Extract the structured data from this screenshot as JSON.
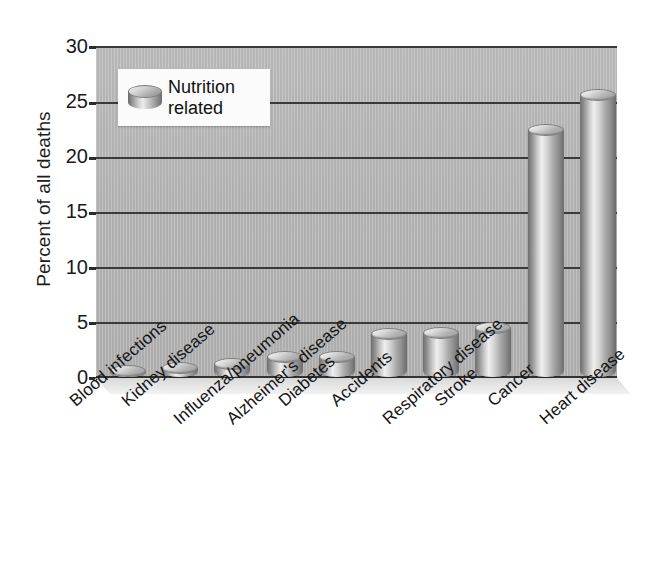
{
  "chart_data": {
    "type": "bar",
    "title": "",
    "xlabel": "",
    "ylabel": "Percent of all deaths",
    "ylim": [
      0,
      30
    ],
    "yticks": [
      0,
      5,
      10,
      15,
      20,
      25,
      30
    ],
    "ytick_labels": [
      "0",
      "5",
      "10",
      "15",
      "20",
      "25",
      "30"
    ],
    "grid": true,
    "legend_position": "upper-left",
    "categories": [
      "Blood infections",
      "Kidney disease",
      "Influenza/pneumonia",
      "Alzheimer's disease",
      "Diabetes",
      "Accidents",
      "Respiratory disease",
      "Stroke",
      "Cancer",
      "Heart disease"
    ],
    "series": [
      {
        "name": "Nutrition related",
        "values": [
          1.1,
          1.4,
          1.7,
          2.4,
          2.4,
          4.4,
          4.5,
          5.0,
          22.9,
          26.1
        ]
      }
    ]
  },
  "legend": {
    "swatch_icon": "cylinder-icon",
    "line1": "Nutrition",
    "line2": "related"
  },
  "colors": {
    "plot_background": "#b6b6b6",
    "gridline": "#3a3a3a",
    "bar_light": "#efefef",
    "bar_mid": "#bdbdbd",
    "bar_dark": "#6e6e6e",
    "text": "#151515",
    "page_background": "#ffffff"
  }
}
